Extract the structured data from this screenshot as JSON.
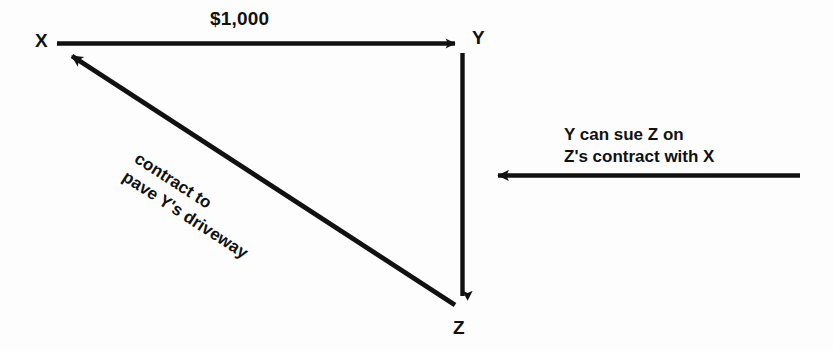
{
  "diagram": {
    "background_color": "#fdfdfd",
    "ink_color": "#111111",
    "nodes": [
      {
        "id": "X",
        "label": "X",
        "x": 48,
        "y": 43
      },
      {
        "id": "Y",
        "label": "Y",
        "x": 478,
        "y": 40
      },
      {
        "id": "Z",
        "label": "Z",
        "x": 462,
        "y": 327
      }
    ],
    "edges": [
      {
        "id": "x-to-y",
        "name": "payment-arrow",
        "from": "X",
        "to": "Y",
        "direction": "right",
        "label": "$1,000",
        "x1": 57,
        "y1": 43,
        "x2": 466,
        "y2": 43
      },
      {
        "id": "y-to-z",
        "name": "vertical-arrow",
        "from": "Y",
        "to": "Z",
        "direction": "down",
        "label": "",
        "x1": 462,
        "y1": 53,
        "x2": 462,
        "y2": 307
      },
      {
        "id": "z-to-x",
        "name": "contract-arrow",
        "from": "Z",
        "to": "X",
        "direction": "upper-left",
        "label_line1": "contract to",
        "label_line2": "pave Y's driveway",
        "rotation_degrees": 33,
        "x1": 455,
        "y1": 305,
        "x2": 60,
        "y2": 48
      },
      {
        "id": "suit-arrow",
        "name": "suit-arrow",
        "from": "right",
        "to": "Z",
        "direction": "left",
        "label_line1": "Y can sue Z on",
        "label_line2": "Z's contract with X",
        "x1": 800,
        "y1": 175,
        "x2": 485,
        "y2": 175
      }
    ]
  }
}
